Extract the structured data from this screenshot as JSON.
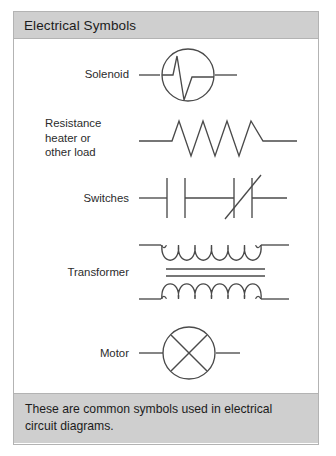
{
  "panel": {
    "header_title": "Electrical Symbols",
    "caption": "These are common symbols used in electrical circuit diagrams.",
    "colors": {
      "header_background": "#cfcfcf",
      "caption_background": "#cfcfcf",
      "border": "#b3b3b3",
      "body_background": "#ffffff",
      "line_color": "#4a4a4a",
      "text_color": "#1c1c1c"
    }
  },
  "symbols": [
    {
      "id": "solenoid",
      "label": "Solenoid",
      "label_lines": [
        "Solenoid"
      ],
      "glyph": "circle-with-pulse-waveform-icon",
      "description": "Circle with sharp pulse waveform inside, horizontal leads on both sides"
    },
    {
      "id": "resistance-heater",
      "label": "Resistance heater or other load",
      "label_lines": [
        "Resistance",
        "heater or",
        "other load"
      ],
      "glyph": "zigzag-resistor-icon",
      "description": "Zigzag resistor with four peaks and horizontal leads"
    },
    {
      "id": "switches",
      "label": "Switches",
      "label_lines": [
        "Switches"
      ],
      "glyph": "switch-contacts-icon",
      "description": "Two pairs of vertical contact bars, second pair crossed by a diagonal line"
    },
    {
      "id": "transformer",
      "label": "Transformer",
      "label_lines": [
        "Transformer"
      ],
      "glyph": "transformer-coils-icon",
      "description": "Two six-loop coils separated by two horizontal core lines"
    },
    {
      "id": "motor",
      "label": "Motor",
      "label_lines": [
        "Motor"
      ],
      "glyph": "circle-with-cross-icon",
      "description": "Circle containing a diagonal cross, with horizontal leads"
    }
  ]
}
